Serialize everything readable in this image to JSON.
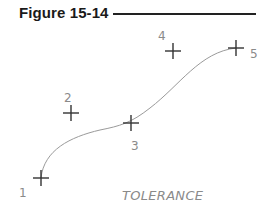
{
  "figure": {
    "title": "Figure 15-14",
    "caption": "TOLERANCE"
  },
  "points": [
    {
      "label": "1",
      "x": 41,
      "y": 178
    },
    {
      "label": "2",
      "x": 71,
      "y": 113
    },
    {
      "label": "3",
      "x": 131,
      "y": 123
    },
    {
      "label": "4",
      "x": 173,
      "y": 51
    },
    {
      "label": "5",
      "x": 236,
      "y": 48
    }
  ],
  "colors": {
    "cross": "#333333",
    "curve": "#9a9a9a",
    "label": "#8a8a8a"
  }
}
